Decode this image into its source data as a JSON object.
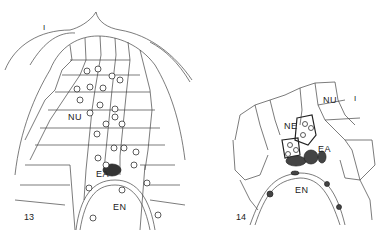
{
  "figures": [
    {
      "number": "13",
      "labels": {
        "integument": "I",
        "nucellus": "NU",
        "egg_apparatus": "EA",
        "endosperm": "EN"
      }
    },
    {
      "number": "14",
      "labels": {
        "nucellus": "NU",
        "scale": "I",
        "nucellar_embryo": "NE",
        "egg_apparatus": "EA",
        "endosperm": "EN"
      }
    }
  ],
  "colors": {
    "ink": "#333333",
    "background": "#ffffff"
  }
}
